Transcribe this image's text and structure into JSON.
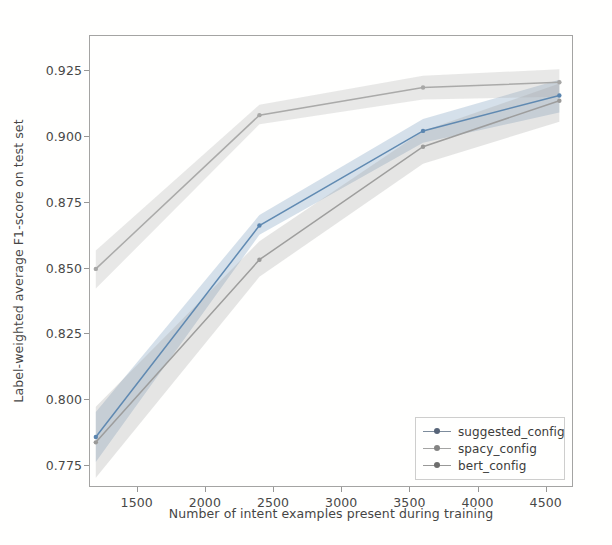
{
  "chart_data": {
    "type": "line",
    "title": "",
    "xlabel": "Number of intent examples present during training",
    "ylabel": "Label-weighted average F1-score on test set",
    "xlim": [
      1150,
      4700
    ],
    "ylim": [
      0.7665,
      0.9385
    ],
    "xticks": [
      1500,
      2000,
      2500,
      3000,
      3500,
      4000,
      4500
    ],
    "xticklabels": [
      "1500",
      "2000",
      "2500",
      "3000",
      "3500",
      "4000",
      "4500"
    ],
    "yticks": [
      0.775,
      0.8,
      0.825,
      0.85,
      0.875,
      0.9,
      0.925
    ],
    "yticklabels": [
      "0.775",
      "0.800",
      "0.825",
      "0.850",
      "0.875",
      "0.900",
      "0.925"
    ],
    "grid": false,
    "legend_position": "lower right",
    "x": [
      1200,
      2400,
      3600,
      4600
    ],
    "series": [
      {
        "name": "suggested_config",
        "color": "#4878a8",
        "band_color": "#4878a8",
        "band_alpha": 0.25,
        "values": [
          0.7855,
          0.866,
          0.902,
          0.9155
        ],
        "lower": [
          0.776,
          0.8625,
          0.8975,
          0.909
        ],
        "upper": [
          0.795,
          0.87,
          0.9065,
          0.9215
        ]
      },
      {
        "name": "spacy_config",
        "color": "#8f8f8f",
        "band_color": "#8f8f8f",
        "band_alpha": 0.25,
        "values": [
          0.7835,
          0.853,
          0.896,
          0.9135
        ],
        "lower": [
          0.77,
          0.8465,
          0.8895,
          0.9055
        ],
        "upper": [
          0.797,
          0.86,
          0.902,
          0.92
        ]
      },
      {
        "name": "bert_config",
        "color": "#9d9d9d",
        "band_color": "#9d9d9d",
        "band_alpha": 0.25,
        "values": [
          0.8495,
          0.908,
          0.9185,
          0.9205
        ],
        "lower": [
          0.842,
          0.9045,
          0.914,
          0.915
        ],
        "upper": [
          0.8565,
          0.912,
          0.923,
          0.9255
        ]
      }
    ]
  },
  "legend": {
    "items": [
      {
        "label": "suggested_config"
      },
      {
        "label": "spacy_config"
      },
      {
        "label": "bert_config"
      }
    ]
  }
}
